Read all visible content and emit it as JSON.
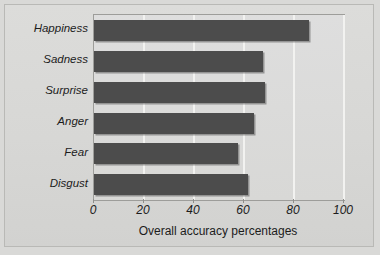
{
  "figure": {
    "caption_remnant": "",
    "background_color": "#d9d9d7",
    "bar_color": "#4c4c4c",
    "gridline_color": "#f2f2f0",
    "plot_border_color": "#9d9d9a"
  },
  "chart_data": {
    "type": "bar",
    "orientation": "horizontal",
    "title": "",
    "subtitle": "",
    "categories": [
      "Happiness",
      "Sadness",
      "Surprise",
      "Anger",
      "Fear",
      "Disgust"
    ],
    "values": [
      86,
      67.5,
      68.5,
      64,
      57.5,
      61.5
    ],
    "series": [
      {
        "name": "Overall accuracy percentages",
        "values": [
          86,
          67.5,
          68.5,
          64,
          57.5,
          61.5
        ]
      }
    ],
    "xlabel": "Overall accuracy percentages",
    "ylabel": "",
    "xlim": [
      0,
      100
    ],
    "xticks": [
      0,
      20,
      40,
      60,
      80,
      100
    ],
    "xticklabels": [
      "0",
      "20",
      "40",
      "60",
      "80",
      "100"
    ],
    "grid": true,
    "grid_axis": "x",
    "legend": false,
    "legend_position": "none",
    "annotations": []
  }
}
